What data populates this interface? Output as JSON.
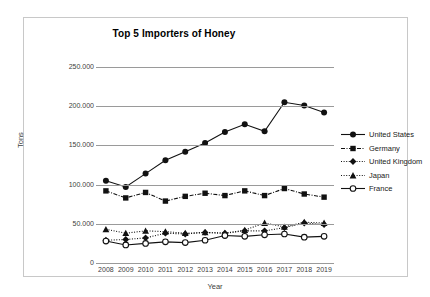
{
  "chart_data": {
    "type": "line",
    "title": "Top 5 Importers of Honey",
    "xlabel": "Year",
    "ylabel": "Tons",
    "categories": [
      "2008",
      "2009",
      "2010",
      "2011",
      "2012",
      "2013",
      "2014",
      "2015",
      "2016",
      "2017",
      "2018",
      "2019"
    ],
    "ylim": [
      0,
      250000
    ],
    "yticks": [
      0,
      50000,
      100000,
      150000,
      200000,
      250000
    ],
    "ytick_labels": [
      "0",
      "50.000",
      "100.000",
      "150.000",
      "200.000",
      "250.000"
    ],
    "grid": "horizontal",
    "legend_position": "right",
    "series": [
      {
        "name": "United States",
        "marker": "filled-circle",
        "line": "solid",
        "values": [
          105000,
          97000,
          114000,
          131000,
          142000,
          153000,
          167000,
          177000,
          168000,
          205000,
          201000,
          192000
        ]
      },
      {
        "name": "Germany",
        "marker": "filled-square",
        "line": "dash-dot",
        "values": [
          92000,
          83000,
          90000,
          79000,
          85000,
          89000,
          86000,
          92000,
          86000,
          95000,
          88000,
          84000
        ]
      },
      {
        "name": "United Kingdom",
        "marker": "filled-diamond",
        "line": "dotted",
        "values": [
          29000,
          30000,
          32000,
          38000,
          37000,
          39000,
          38000,
          41000,
          41000,
          45000,
          51000,
          49000
        ]
      },
      {
        "name": "Japan",
        "marker": "filled-triangle",
        "line": "dotted",
        "values": [
          43000,
          38000,
          41000,
          40000,
          38000,
          39000,
          38000,
          42000,
          51000,
          46000,
          52000,
          51000
        ]
      },
      {
        "name": "France",
        "marker": "open-circle",
        "line": "solid",
        "values": [
          28000,
          23000,
          25000,
          27000,
          26000,
          29000,
          35000,
          34000,
          36000,
          37000,
          33000,
          34000
        ]
      }
    ]
  }
}
